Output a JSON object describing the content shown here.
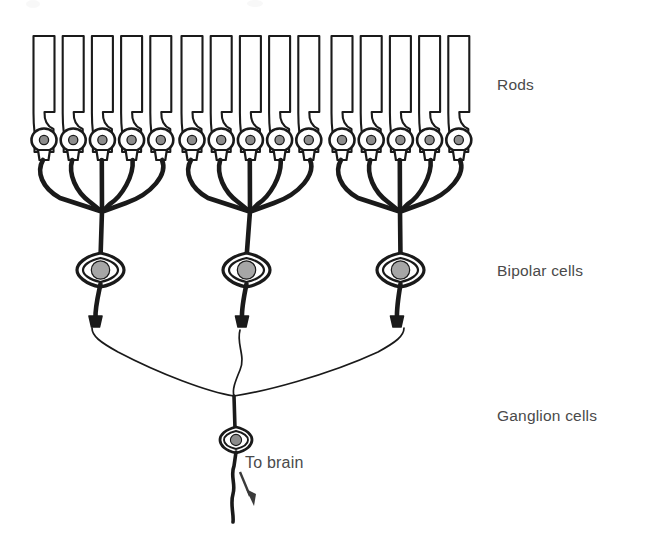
{
  "figure": {
    "background_color": "#ffffff",
    "ink_color": "#1a1a1a",
    "label_color": "#4a4a4a",
    "nucleus_color": "#8c8c8c",
    "bipolar_nucleus_color": "#a6a6a6",
    "width": 645,
    "height": 540
  },
  "labels": {
    "rods": "Rods",
    "bipolar_cells": "Bipolar cells",
    "ganglion_cells": "Ganglion cells",
    "to_brain": "To brain"
  },
  "label_positions": {
    "rods": {
      "x": 497,
      "y": 90
    },
    "bipolar_cells": {
      "x": 497,
      "y": 276
    },
    "ganglion_cells": {
      "x": 497,
      "y": 421
    },
    "to_brain": {
      "x": 245,
      "y": 468
    }
  },
  "counts": {
    "rods_total": 15,
    "rod_groups": 3,
    "rods_per_group": 5,
    "bipolar_cells": 3,
    "ganglion_cells": 1,
    "convergence_ratio_rods_to_bipolar": "5:1",
    "convergence_ratio_bipolar_to_ganglion": "3:1"
  },
  "geometry": {
    "rod_top_y": 36,
    "rod_body_bottom_y": 112,
    "rod_soma_cy": 140,
    "rod_soma_r": 12.5,
    "rod_nucleus_r": 4.6,
    "rod_terminal_y": 156,
    "rod_width": 22,
    "rod_pitch": 29.2,
    "bipolar_soma_cy": 270,
    "bipolar_terminal_y": 322,
    "ganglion_cx": 236,
    "ganglion_cy": 440,
    "axon_end_y": 522
  },
  "rods": [
    {
      "index": 1,
      "group": 1,
      "cx": 44
    },
    {
      "index": 2,
      "group": 1,
      "cx": 73
    },
    {
      "index": 3,
      "group": 1,
      "cx": 102
    },
    {
      "index": 4,
      "group": 1,
      "cx": 131
    },
    {
      "index": 5,
      "group": 1,
      "cx": 160
    },
    {
      "index": 6,
      "group": 2,
      "cx": 192
    },
    {
      "index": 7,
      "group": 2,
      "cx": 221
    },
    {
      "index": 8,
      "group": 2,
      "cx": 250
    },
    {
      "index": 9,
      "group": 2,
      "cx": 279
    },
    {
      "index": 10,
      "group": 2,
      "cx": 308
    },
    {
      "index": 11,
      "group": 3,
      "cx": 342
    },
    {
      "index": 12,
      "group": 3,
      "cx": 371
    },
    {
      "index": 13,
      "group": 3,
      "cx": 400
    },
    {
      "index": 14,
      "group": 3,
      "cx": 429
    },
    {
      "index": 15,
      "group": 3,
      "cx": 458
    }
  ],
  "bipolars": [
    {
      "index": 1,
      "cx": 100,
      "convergence_node_x": 102,
      "convergence_node_y": 212
    },
    {
      "index": 2,
      "cx": 246,
      "convergence_node_x": 250,
      "convergence_node_y": 212
    },
    {
      "index": 3,
      "cx": 400,
      "convergence_node_x": 400,
      "convergence_node_y": 212
    }
  ],
  "ganglion": {
    "cx": 236,
    "cy": 440,
    "dendrite_junction_x": 234,
    "dendrite_junction_y": 395,
    "axon_tip_y": 522
  }
}
